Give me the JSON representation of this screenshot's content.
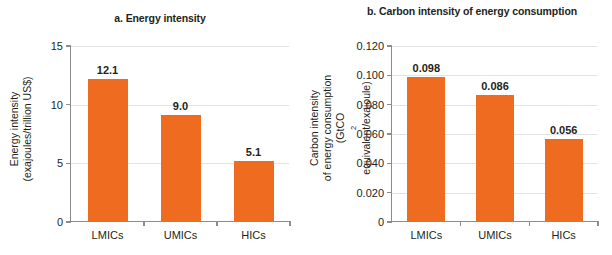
{
  "figure": {
    "background": "#ffffff",
    "bar_color": "#ee6b20",
    "grid_color": "#e3e3e3",
    "axis_color": "#8c8c8c",
    "text_color": "#231f20"
  },
  "chart_data": [
    {
      "type": "bar",
      "panel": "a",
      "title": "a. Energy intensity",
      "xlabel": "",
      "ylabel_line1": "Energy intensity",
      "ylabel_line2": "(exajoules/trillion US$)",
      "categories": [
        "LMICs",
        "UMICs",
        "HICs"
      ],
      "values": [
        12.1,
        9.0,
        5.1
      ],
      "value_labels": [
        "12.1",
        "9.0",
        "5.1"
      ],
      "ylim": [
        0,
        15
      ],
      "yticks": [
        0,
        5,
        10,
        15
      ],
      "ytick_labels": [
        "0",
        "5",
        "10",
        "15"
      ],
      "grid": true,
      "legend": "none"
    },
    {
      "type": "bar",
      "panel": "b",
      "title_line1": "b. Carbon intensity",
      "title_line2": "of energy consumption",
      "xlabel": "",
      "ylabel_line1": "Carbon intensity",
      "ylabel_line2": "of energy consumption",
      "ylabel_line3_a": "(GtCO",
      "ylabel_line3_sub": "2",
      "ylabel_line3_b": " equivalent/exajoule)",
      "categories": [
        "LMICs",
        "UMICs",
        "HICs"
      ],
      "values": [
        0.098,
        0.086,
        0.056
      ],
      "value_labels": [
        "0.098",
        "0.086",
        "0.056"
      ],
      "ylim": [
        0,
        0.12
      ],
      "yticks": [
        0,
        0.02,
        0.04,
        0.06,
        0.08,
        0.1,
        0.12
      ],
      "ytick_labels": [
        "0",
        "0.020",
        "0.040",
        "0.060",
        "0.080",
        "0.100",
        "0.120"
      ],
      "grid": true,
      "legend": "none"
    }
  ]
}
